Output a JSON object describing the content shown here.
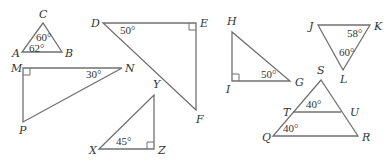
{
  "diagram": {
    "colors": {
      "stroke": "#707070",
      "text": "#333333",
      "background": "#ffffff"
    },
    "triangles": [
      {
        "id": "ABC",
        "vertices": [
          {
            "name": "A",
            "x": 22,
            "y": 52,
            "label_x": 12,
            "label_y": 57
          },
          {
            "name": "B",
            "x": 62,
            "y": 52,
            "label_x": 65,
            "label_y": 57
          },
          {
            "name": "C",
            "x": 43,
            "y": 23,
            "label_x": 39,
            "label_y": 18
          }
        ],
        "angles": [
          {
            "text": "60°",
            "x": 36,
            "y": 41
          },
          {
            "text": "62°",
            "x": 29,
            "y": 52
          }
        ]
      },
      {
        "id": "DEF",
        "vertices": [
          {
            "name": "D",
            "x": 103,
            "y": 23,
            "label_x": 91,
            "label_y": 27
          },
          {
            "name": "E",
            "x": 196,
            "y": 23,
            "label_x": 200,
            "label_y": 27
          },
          {
            "name": "F",
            "x": 196,
            "y": 110,
            "label_x": 196,
            "label_y": 123
          }
        ],
        "angles": [
          {
            "text": "50°",
            "x": 120,
            "y": 34
          }
        ],
        "right_angle_at": "E"
      },
      {
        "id": "GHI",
        "vertices": [
          {
            "name": "H",
            "x": 232,
            "y": 32,
            "label_x": 227,
            "label_y": 25
          },
          {
            "name": "I",
            "x": 232,
            "y": 81,
            "label_x": 226,
            "label_y": 93
          },
          {
            "name": "G",
            "x": 290,
            "y": 81,
            "label_x": 295,
            "label_y": 86
          }
        ],
        "angles": [
          {
            "text": "50°",
            "x": 261,
            "y": 78
          }
        ],
        "right_angle_at": "I"
      },
      {
        "id": "JKL",
        "vertices": [
          {
            "name": "J",
            "x": 318,
            "y": 25,
            "label_x": 309,
            "label_y": 30
          },
          {
            "name": "K",
            "x": 370,
            "y": 25,
            "label_x": 374,
            "label_y": 30
          },
          {
            "name": "L",
            "x": 343,
            "y": 70,
            "label_x": 340,
            "label_y": 83
          }
        ],
        "angles": [
          {
            "text": "58°",
            "x": 347,
            "y": 37
          },
          {
            "text": "60°",
            "x": 339,
            "y": 56
          }
        ]
      },
      {
        "id": "MNP",
        "vertices": [
          {
            "name": "M",
            "x": 23,
            "y": 68,
            "label_x": 11,
            "label_y": 72
          },
          {
            "name": "N",
            "x": 122,
            "y": 68,
            "label_x": 125,
            "label_y": 72
          },
          {
            "name": "P",
            "x": 23,
            "y": 122,
            "label_x": 19,
            "label_y": 134
          }
        ],
        "angles": [
          {
            "text": "30°",
            "x": 86,
            "y": 78
          }
        ],
        "right_angle_at": "M"
      },
      {
        "id": "XYZ",
        "vertices": [
          {
            "name": "X",
            "x": 99,
            "y": 149,
            "label_x": 89,
            "label_y": 154
          },
          {
            "name": "Y",
            "x": 154,
            "y": 95,
            "label_x": 153,
            "label_y": 88
          },
          {
            "name": "Z",
            "x": 154,
            "y": 149,
            "label_x": 158,
            "label_y": 154
          }
        ],
        "angles": [
          {
            "text": "45°",
            "x": 116,
            "y": 145
          }
        ],
        "right_angle_at": "Z"
      },
      {
        "id": "QRS",
        "vertices": [
          {
            "name": "S",
            "x": 321,
            "y": 80,
            "label_x": 317,
            "label_y": 74
          },
          {
            "name": "Q",
            "x": 273,
            "y": 136,
            "label_x": 262,
            "label_y": 141
          },
          {
            "name": "R",
            "x": 358,
            "y": 136,
            "label_x": 362,
            "label_y": 141
          }
        ],
        "segment": {
          "from": {
            "name": "T",
            "x": 293,
            "y": 112,
            "label_x": 283,
            "label_y": 116
          },
          "to": {
            "name": "U",
            "x": 341,
            "y": 112,
            "label_x": 350,
            "label_y": 116
          }
        },
        "angles": [
          {
            "text": "40°",
            "x": 306,
            "y": 108
          },
          {
            "text": "40°",
            "x": 283,
            "y": 132
          }
        ]
      }
    ]
  }
}
